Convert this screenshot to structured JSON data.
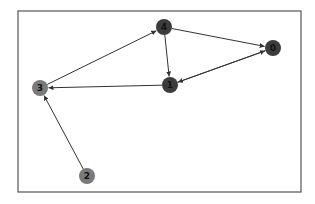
{
  "diagram": {
    "type": "directed-graph",
    "frame": {
      "x": 18,
      "y": 11,
      "width": 283,
      "height": 181,
      "stroke": "#555555"
    },
    "edge_color": "#333333",
    "nodes": [
      {
        "id": "0",
        "label": "0",
        "x": 273,
        "y": 48,
        "fill": "#3c3c3c"
      },
      {
        "id": "1",
        "label": "1",
        "x": 170,
        "y": 85,
        "fill": "#3c3c3c"
      },
      {
        "id": "2",
        "label": "2",
        "x": 87,
        "y": 176,
        "fill": "#7a7a7a"
      },
      {
        "id": "3",
        "label": "3",
        "x": 40,
        "y": 88,
        "fill": "#7a7a7a"
      },
      {
        "id": "4",
        "label": "4",
        "x": 164,
        "y": 27,
        "fill": "#3c3c3c"
      }
    ],
    "edges": [
      {
        "from": "3",
        "to": "4"
      },
      {
        "from": "4",
        "to": "1"
      },
      {
        "from": "4",
        "to": "0"
      },
      {
        "from": "1",
        "to": "3"
      },
      {
        "from": "0",
        "to": "1"
      },
      {
        "from": "1",
        "to": "0"
      },
      {
        "from": "2",
        "to": "3"
      }
    ]
  }
}
